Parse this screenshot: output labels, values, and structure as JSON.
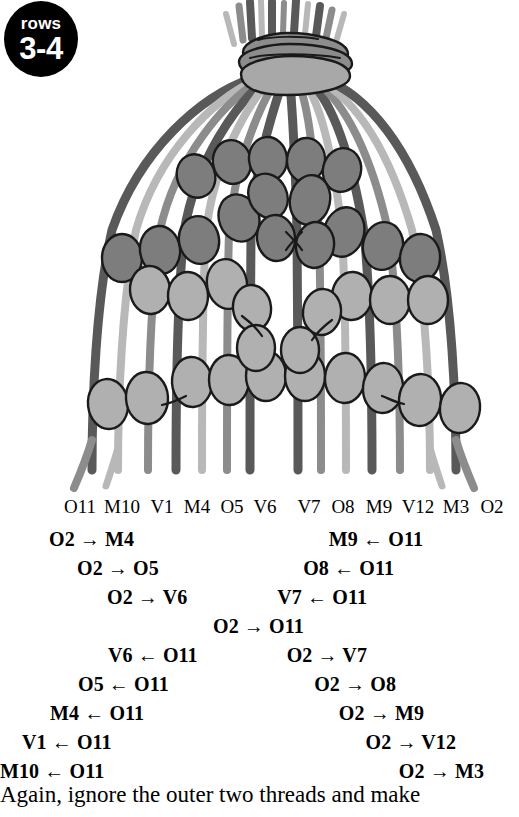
{
  "badge": {
    "top_label": "rows",
    "main_label": "3-4"
  },
  "diagram": {
    "name": "macrame-beaded-bell-diagram",
    "colors": {
      "outline": "#1a1a1a",
      "thread_dark": "#595959",
      "thread_medium": "#8c8c8c",
      "thread_light": "#b8b8b8",
      "bead_dark": "#7d7d7d",
      "bead_light": "#b0b0b0",
      "knot_band": "#8c8c8c"
    }
  },
  "thread_labels": [
    {
      "label": "O11",
      "x": 80
    },
    {
      "label": "M10",
      "x": 122
    },
    {
      "label": "V1",
      "x": 162
    },
    {
      "label": "M4",
      "x": 197
    },
    {
      "label": "O5",
      "x": 232
    },
    {
      "label": "V6",
      "x": 265
    },
    {
      "label": "V7",
      "x": 309
    },
    {
      "label": "O8",
      "x": 343
    },
    {
      "label": "M9",
      "x": 379
    },
    {
      "label": "V12",
      "x": 418
    },
    {
      "label": "M3",
      "x": 456
    },
    {
      "label": "O2",
      "x": 492
    }
  ],
  "instructions": {
    "left_column": [
      {
        "text": "O2 → M4",
        "left": 49,
        "top": 0
      },
      {
        "text": "O2 → O5",
        "left": 77,
        "top": 29
      },
      {
        "text": "O2 → V6",
        "left": 107,
        "top": 58
      },
      {
        "text": "V6 ← O11",
        "left": 108,
        "top": 116
      },
      {
        "text": "O5 ← O11",
        "left": 78,
        "top": 145
      },
      {
        "text": "M4 ← O11",
        "left": 50,
        "top": 174
      },
      {
        "text": "V1 ← O11",
        "left": 22,
        "top": 203
      },
      {
        "text": "M10 ← O11",
        "left": 0,
        "top": 232
      }
    ],
    "center_line": {
      "text": "O2 → O11",
      "left": 213,
      "top": 87
    },
    "right_column": [
      {
        "text": "M9 ← O11",
        "right": 96,
        "top": 0
      },
      {
        "text": "O8 ← O11",
        "right": 125,
        "top": 29
      },
      {
        "text": "V7 ← O11",
        "right": 152,
        "top": 58
      },
      {
        "text": "O2 → V7",
        "right": 152,
        "top": 116
      },
      {
        "text": "O2 → O8",
        "right": 123,
        "top": 145
      },
      {
        "text": "O2 → M9",
        "right": 95,
        "top": 174
      },
      {
        "text": "O2 → V12",
        "right": 63,
        "top": 203
      },
      {
        "text": "O2 → M3",
        "right": 35,
        "top": 232
      }
    ]
  },
  "caption": {
    "text": "Again, ignore the outer two threads and make"
  }
}
